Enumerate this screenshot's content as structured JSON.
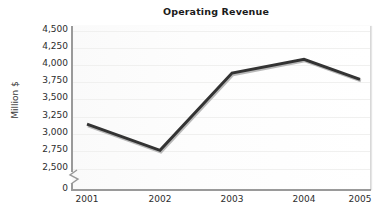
{
  "chart_data": {
    "type": "line",
    "title": "Operating Revenue",
    "xlabel": "",
    "ylabel": "Million $",
    "categories": [
      "2001",
      "2002",
      "2003",
      "2004",
      "2005"
    ],
    "values": [
      3150,
      2770,
      3890,
      4090,
      3800
    ],
    "series": [
      {
        "name": "Operating Revenue",
        "values": [
          3150,
          2770,
          3890,
          4090,
          3800
        ],
        "color": "#333333"
      }
    ],
    "ylim": [
      2500,
      4500
    ],
    "y_ticks": [
      "4,500",
      "4,250",
      "4,000",
      "3,750",
      "3,500",
      "3,250",
      "3,000",
      "2,750",
      "2,500",
      "0"
    ],
    "y_tick_values": [
      4500,
      4250,
      4000,
      3750,
      3500,
      3250,
      3000,
      2750,
      2500,
      0
    ],
    "y_axis_break": true,
    "y_axis_break_icon": "axis-break-zigzag",
    "grid": true,
    "legend": false,
    "legend_position": "none",
    "plot_background": "#fcfcfc",
    "line_color": "#333333",
    "axis_color": "#9a9a9a",
    "text_color": "#2d2d2d",
    "title_color": "#1b1b1b"
  }
}
